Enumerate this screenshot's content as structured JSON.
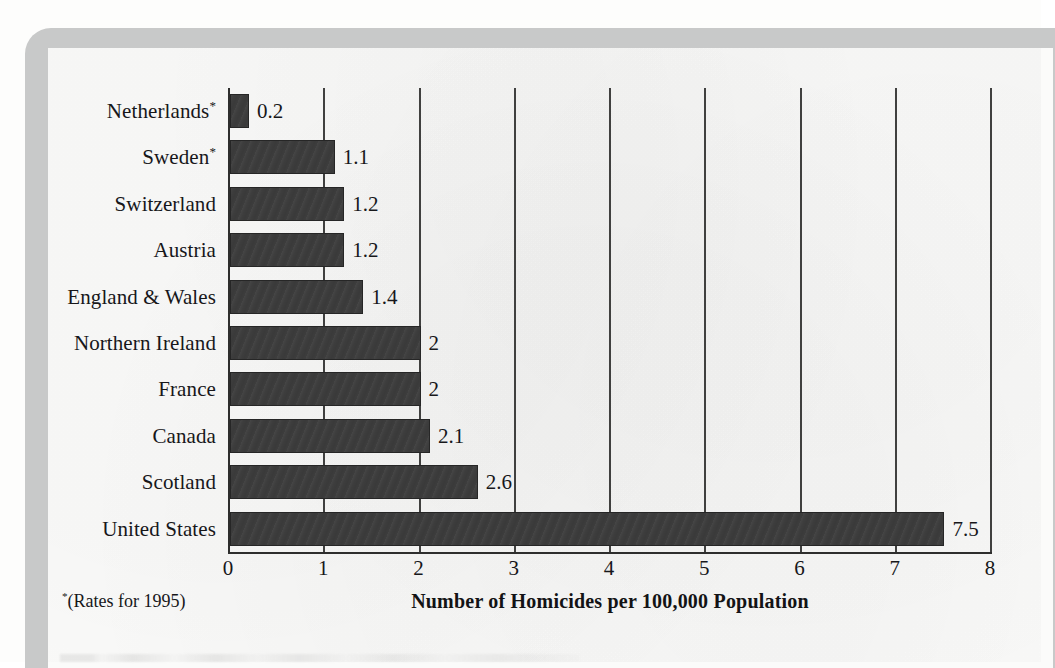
{
  "chart_data": {
    "type": "bar",
    "orientation": "horizontal",
    "title": "",
    "xlabel": "Number of Homicides per 100,000 Population",
    "ylabel": "",
    "xlim": [
      0,
      8
    ],
    "xticks": [
      "0",
      "1",
      "2",
      "3",
      "4",
      "5",
      "6",
      "7",
      "8"
    ],
    "grid": "vertical",
    "legend": "none",
    "categories": [
      "Netherlands*",
      "Sweden*",
      "Switzerland",
      "Austria",
      "England & Wales",
      "Northern Ireland",
      "France",
      "Canada",
      "Scotland",
      "United States"
    ],
    "values": [
      0.2,
      1.1,
      1.2,
      1.2,
      1.4,
      2,
      2,
      2.1,
      2.6,
      7.5
    ],
    "value_labels": [
      "0.2",
      "1.1",
      "1.2",
      "1.2",
      "1.4",
      "2",
      "2",
      "2.1",
      "2.6",
      "7.5"
    ],
    "bars": [
      {
        "label": "Netherlands",
        "footnote_marker": "*",
        "value": 0.2,
        "value_label": "0.2"
      },
      {
        "label": "Sweden",
        "footnote_marker": "*",
        "value": 1.1,
        "value_label": "1.1"
      },
      {
        "label": "Switzerland",
        "footnote_marker": "",
        "value": 1.2,
        "value_label": "1.2"
      },
      {
        "label": "Austria",
        "footnote_marker": "",
        "value": 1.2,
        "value_label": "1.2"
      },
      {
        "label": "England & Wales",
        "footnote_marker": "",
        "value": 1.4,
        "value_label": "1.4"
      },
      {
        "label": "Northern Ireland",
        "footnote_marker": "",
        "value": 2,
        "value_label": "2"
      },
      {
        "label": "France",
        "footnote_marker": "",
        "value": 2,
        "value_label": "2"
      },
      {
        "label": "Canada",
        "footnote_marker": "",
        "value": 2.1,
        "value_label": "2.1"
      },
      {
        "label": "Scotland",
        "footnote_marker": "",
        "value": 2.6,
        "value_label": "2.6"
      },
      {
        "label": "United States",
        "footnote_marker": "",
        "value": 7.5,
        "value_label": "7.5"
      }
    ]
  },
  "footnote": {
    "marker": "*",
    "text": "(Rates for 1995)"
  },
  "colors": {
    "bar_fill": "#3d3d3d",
    "bar_border": "#262626",
    "gridline": "#40403f",
    "axis": "#2e2e2d",
    "text": "#17171a",
    "page": "#fbfbfa",
    "page_border": "#c8c9c9"
  }
}
